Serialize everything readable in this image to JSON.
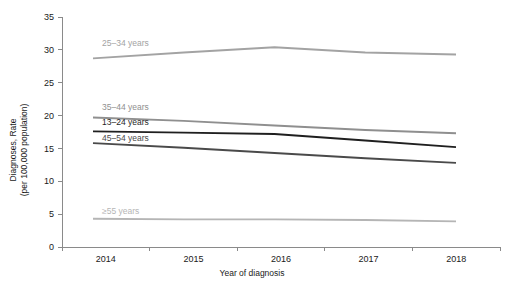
{
  "chart_data": {
    "type": "line",
    "title": "",
    "xlabel": "Year of diagnosis",
    "ylabel": "Diagnoses, Rate\n(per 100,000 population)",
    "ylabel_line1": "Diagnoses, Rate",
    "ylabel_line2": "(per 100,000 population)",
    "x": [
      2014,
      2015,
      2016,
      2017,
      2018
    ],
    "xtick_labels": [
      "2014",
      "2015",
      "2016",
      "2017",
      "2018"
    ],
    "ytick_labels": [
      "0",
      "5",
      "10",
      "15",
      "20",
      "25",
      "30",
      "35"
    ],
    "ytick_values": [
      0,
      5,
      10,
      15,
      20,
      25,
      30,
      35
    ],
    "ylim": [
      0,
      35
    ],
    "grid": false,
    "legend_position": "inline-labels",
    "series": [
      {
        "name": "25–34 years",
        "color": "#a3a3a3",
        "values": [
          28.7,
          29.6,
          30.4,
          29.6,
          29.3
        ],
        "label_x": 2014.1,
        "label_y": 30.6
      },
      {
        "name": "35–44 years",
        "color": "#8f8f8f",
        "values": [
          19.7,
          19.2,
          18.5,
          17.8,
          17.3
        ],
        "label_x": 2014.1,
        "label_y": 20.8
      },
      {
        "name": "13–24 years",
        "color": "#1f1f1f",
        "values": [
          17.6,
          17.4,
          17.2,
          16.2,
          15.2
        ],
        "label_x": 2014.1,
        "label_y": 18.6
      },
      {
        "name": "45–54 years",
        "color": "#4a4a4a",
        "values": [
          15.8,
          15.1,
          14.3,
          13.5,
          12.8
        ],
        "label_x": 2014.1,
        "label_y": 16.2
      },
      {
        "name": "≥55 years",
        "color": "#b5b5b5",
        "values": [
          4.3,
          4.2,
          4.2,
          4.1,
          3.9
        ],
        "label_x": 2014.1,
        "label_y": 5.0
      }
    ]
  },
  "axis": {
    "x_title": "Year of diagnosis",
    "y_title_line1": "Diagnoses, Rate",
    "y_title_line2": "(per 100,000 population)"
  }
}
